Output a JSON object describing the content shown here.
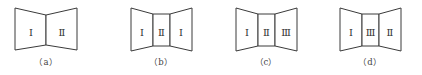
{
  "figures": [
    {
      "id": "a",
      "caption": "（a）",
      "panels": [
        {
          "label": "Ⅰ",
          "points": "15,8 46,15 46,45 15,50",
          "lx": 31,
          "ly": 33
        },
        {
          "label": "Ⅱ",
          "points": "46,15 77,8 77,50 46,45",
          "lx": 62,
          "ly": 33
        }
      ],
      "cap_x": 46,
      "cap_y": 65
    },
    {
      "id": "b",
      "caption": "（b）",
      "panels": [
        {
          "label": "Ⅰ",
          "points": "131,8 153,14 153,46 131,51",
          "lx": 142,
          "ly": 33
        },
        {
          "label": "Ⅱ",
          "points": "153,14 170,14 170,46 153,46",
          "lx": 161.5,
          "ly": 33
        },
        {
          "label": "Ⅰ",
          "points": "170,14 192,8 192,51 170,46",
          "lx": 181,
          "ly": 33
        }
      ],
      "cap_x": 161,
      "cap_y": 65
    },
    {
      "id": "c",
      "caption": "（c）",
      "panels": [
        {
          "label": "Ⅰ",
          "points": "236,8 258,14 258,46 236,51",
          "lx": 247,
          "ly": 33
        },
        {
          "label": "Ⅱ",
          "points": "258,14 275,14 275,46 258,46",
          "lx": 266.5,
          "ly": 33
        },
        {
          "label": "Ⅲ",
          "points": "275,14 297,8 297,51 275,46",
          "lx": 286,
          "ly": 33
        }
      ],
      "cap_x": 266,
      "cap_y": 65
    },
    {
      "id": "d",
      "caption": "（d）",
      "panels": [
        {
          "label": "Ⅰ",
          "points": "340,8 362,14 362,46 340,51",
          "lx": 351,
          "ly": 33
        },
        {
          "label": "Ⅲ",
          "points": "362,14 379,14 379,46 362,46",
          "lx": 370.5,
          "ly": 33
        },
        {
          "label": "Ⅱ",
          "points": "379,14 401,8 401,51 379,46",
          "lx": 390,
          "ly": 33
        }
      ],
      "cap_x": 370,
      "cap_y": 65
    }
  ],
  "colors": {
    "stroke": "#3a3a3a",
    "text": "#333333",
    "background": "#ffffff"
  }
}
